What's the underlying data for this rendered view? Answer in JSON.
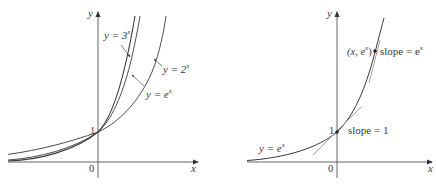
{
  "left_graph": {
    "axis_x_label": "x",
    "axis_y_label": "y",
    "origin_label": "0",
    "y_intercept_label": "1",
    "curves": [
      {
        "name": "3^x",
        "label_prefix": "y = 3",
        "label_sup": "x"
      },
      {
        "name": "e^x",
        "label_prefix": "y = e",
        "label_sup": "x"
      },
      {
        "name": "2^x",
        "label_prefix": "y = 2",
        "label_sup": "x"
      }
    ]
  },
  "right_graph": {
    "axis_x_label": "x",
    "axis_y_label": "y",
    "origin_label": "0",
    "y_intercept_label": "1",
    "curve_label_prefix": "y = e",
    "curve_label_sup": "x",
    "point_label_prefix": "(x, e",
    "point_label_sup": "x",
    "point_label_suffix": ")",
    "slope_at_point_prefix": "slope = e",
    "slope_at_point_sup": "x",
    "slope_at_zero": "slope = 1"
  },
  "colors": {
    "axis": "#555555",
    "curve": "#3a3a3a",
    "tangent": "#888888"
  }
}
